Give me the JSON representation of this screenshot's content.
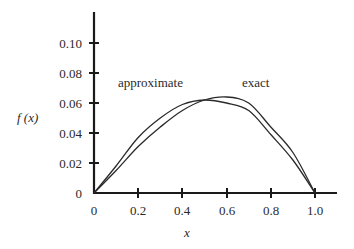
{
  "chart_data": {
    "type": "line",
    "title": "",
    "xlabel": "x",
    "ylabel": "f(x)",
    "xlim": [
      0,
      1.1
    ],
    "ylim": [
      0,
      0.12
    ],
    "grid": false,
    "legend": "inline labels",
    "x_ticks": [
      "0",
      "0.2",
      "0.4",
      "0.6",
      "0.8",
      "1.0"
    ],
    "y_ticks": [
      "0",
      "0.02",
      "0.04",
      "0.06",
      "0.08",
      "0.10"
    ],
    "x": [
      0,
      0.1,
      0.2,
      0.3,
      0.4,
      0.5,
      0.6,
      0.7,
      0.8,
      0.9,
      1.0
    ],
    "series": [
      {
        "name": "approximate",
        "values": [
          0,
          0.018,
          0.037,
          0.05,
          0.059,
          0.062,
          0.06,
          0.055,
          0.039,
          0.022,
          0
        ]
      },
      {
        "name": "exact",
        "values": [
          0,
          0.015,
          0.031,
          0.044,
          0.055,
          0.062,
          0.064,
          0.06,
          0.044,
          0.027,
          0
        ]
      }
    ],
    "annotations": [
      {
        "text": "approximate",
        "x": 0.11,
        "y": 0.071
      },
      {
        "text": "exact",
        "x": 0.67,
        "y": 0.071
      }
    ]
  },
  "labels": {
    "ylabel": "f (x)",
    "xlabel": "x",
    "approximate": "approximate",
    "exact": "exact",
    "xt0": "0",
    "xt1": "0.2",
    "xt2": "0.4",
    "xt3": "0.6",
    "xt4": "0.8",
    "xt5": "1.0",
    "yt0": "0",
    "yt1": "0.02",
    "yt2": "0.04",
    "yt3": "0.06",
    "yt4": "0.08",
    "yt5": "0.10"
  }
}
